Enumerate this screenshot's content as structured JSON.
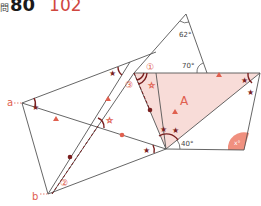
{
  "header": {
    "problem_mark": "問",
    "problem_number": "80",
    "answer": "102"
  },
  "labels": {
    "angle_top": "62°",
    "angle_70": "70°",
    "angle_40": "40°",
    "angle_x": "x°",
    "region_A": "A",
    "point_a": "a",
    "point_b": "b",
    "circled_1": "①",
    "circled_2": "②",
    "circled_3": "③"
  },
  "colors": {
    "line": "#555555",
    "accent": "#e0604f",
    "dark_mark": "#7a1f1f",
    "fill_region": "#f8dcd8",
    "fill_x": "#f0907f"
  }
}
